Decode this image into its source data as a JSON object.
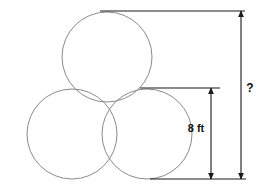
{
  "figure": {
    "background_color": "#ffffff",
    "circle_stroke_color": "#8a8a8a",
    "dimension_line_color": "#1a1a1a",
    "label_color": "#111111",
    "circles": [
      {
        "name": "top-circle",
        "cx": 107,
        "cy": 57,
        "r": 45
      },
      {
        "name": "bottom-left-circle",
        "cx": 72,
        "cy": 134,
        "r": 45
      },
      {
        "name": "bottom-right-circle",
        "cx": 147,
        "cy": 134,
        "r": 45
      }
    ],
    "extension_lines": [
      {
        "name": "top-extension-line",
        "x1": 100,
        "y1": 11,
        "x2": 245,
        "y2": 11
      },
      {
        "name": "middle-extension-line",
        "x1": 140,
        "y1": 88,
        "x2": 220,
        "y2": 88
      },
      {
        "name": "bottom-extension-line",
        "x1": 150,
        "y1": 179,
        "x2": 246,
        "y2": 179
      }
    ],
    "dimensions": [
      {
        "name": "inner-dimension-8ft",
        "label": "8 ft",
        "value": 8,
        "unit": "ft",
        "x": 211,
        "y_top": 88,
        "y_bottom": 179,
        "label_x": 196,
        "label_y": 132,
        "label_anchor": "middle"
      },
      {
        "name": "outer-dimension-unknown",
        "label": "?",
        "value": null,
        "unit": "",
        "x": 241,
        "y_top": 11,
        "y_bottom": 179,
        "label_x": 250,
        "label_y": 92,
        "label_anchor": "middle"
      }
    ]
  }
}
